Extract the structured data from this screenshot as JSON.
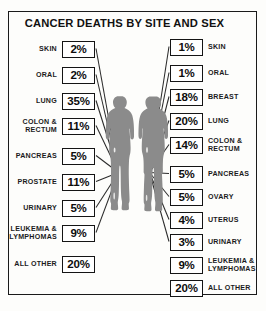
{
  "chart_data": {
    "type": "bar",
    "title": "CANCER DEATHS BY SITE AND SEX",
    "xlabel": "",
    "ylabel": "",
    "units": "percent of cancer deaths",
    "grid": false,
    "legend_position": "none",
    "annotations": [
      "Male silhouette (left) keys the left-hand percentage boxes",
      "Female silhouette (right) keys the right-hand percentage boxes",
      "Leader lines radiate from each figure's torso to its value box"
    ],
    "series": [
      {
        "name": "Male",
        "side": "left",
        "categories": [
          "SKIN",
          "ORAL",
          "LUNG",
          "COLON &\nRECTUM",
          "PANCREAS",
          "PROSTATE",
          "URINARY",
          "LEUKEMIA &\nLYMPHOMAS",
          "ALL OTHER"
        ],
        "values": [
          2,
          2,
          35,
          11,
          5,
          11,
          5,
          9,
          20
        ],
        "value_labels": [
          "2%",
          "2%",
          "35%",
          "11%",
          "5%",
          "11%",
          "5%",
          "9%",
          "20%"
        ]
      },
      {
        "name": "Female",
        "side": "right",
        "categories": [
          "SKIN",
          "ORAL",
          "BREAST",
          "LUNG",
          "COLON &\nRECTUM",
          "PANCREAS",
          "OVARY",
          "UTERUS",
          "URINARY",
          "LEUKEMIA &\nLYMPHOMAS",
          "ALL OTHER"
        ],
        "values": [
          1,
          1,
          18,
          20,
          14,
          5,
          5,
          4,
          3,
          9,
          20
        ],
        "value_labels": [
          "1%",
          "1%",
          "18%",
          "20%",
          "14%",
          "5%",
          "5%",
          "4%",
          "3%",
          "9%",
          "20%"
        ]
      }
    ]
  },
  "colors": {
    "frame": "#1a1a1a",
    "figure_fill": "#8b8b8b",
    "leader_line": "#2a2a2a",
    "box_border": "#141414",
    "background": "#fdfdfb",
    "text": "#111111"
  },
  "figures": {
    "male_name": "male-silhouette",
    "female_name": "female-silhouette"
  }
}
